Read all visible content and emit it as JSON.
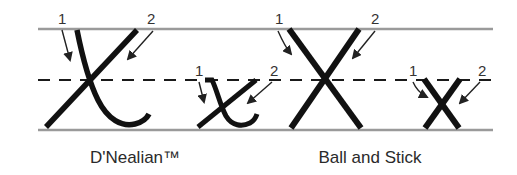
{
  "figure": {
    "subject_letter": "x",
    "styles": [
      {
        "name": "D'Nealian™",
        "letters": [
          {
            "case": "uppercase",
            "stroke_numbers": [
              "1",
              "2"
            ]
          },
          {
            "case": "lowercase",
            "stroke_numbers": [
              "1",
              "2"
            ]
          }
        ]
      },
      {
        "name": "Ball and Stick",
        "letters": [
          {
            "case": "uppercase",
            "stroke_numbers": [
              "1",
              "2"
            ]
          },
          {
            "case": "lowercase",
            "stroke_numbers": [
              "1",
              "2"
            ]
          }
        ]
      }
    ],
    "guide_lines": [
      "top line",
      "dashed midline",
      "baseline"
    ]
  },
  "colors": {
    "guide_line": "#9a9a9a",
    "letter_stroke": "#111111",
    "text": "#2a2a2a"
  }
}
